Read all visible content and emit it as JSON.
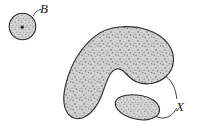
{
  "figure": {
    "background_color": "#ffffff",
    "outline_color": "#2b2b2b",
    "fill_color": "#cfcfcf",
    "stipple_color": "#8e8e8e",
    "labels": {
      "small_disk": "B",
      "region": "X"
    },
    "shapes": [
      {
        "name": "small-disk-B",
        "kind": "circle",
        "center_x": 22.5,
        "center_y": 26.5,
        "radius": 13.5,
        "has_center_dot": true,
        "center_dot_radius": 1.6,
        "filled": true
      },
      {
        "name": "large-crescent-region-X",
        "kind": "blob",
        "filled": true
      },
      {
        "name": "small-oval-region-X",
        "kind": "blob",
        "filled": true
      }
    ],
    "leaders": [
      {
        "name": "leader-to-small-disk",
        "label": "B"
      },
      {
        "name": "leader-to-large-region",
        "label": "X"
      },
      {
        "name": "leader-to-small-oval",
        "label": "X"
      }
    ]
  }
}
